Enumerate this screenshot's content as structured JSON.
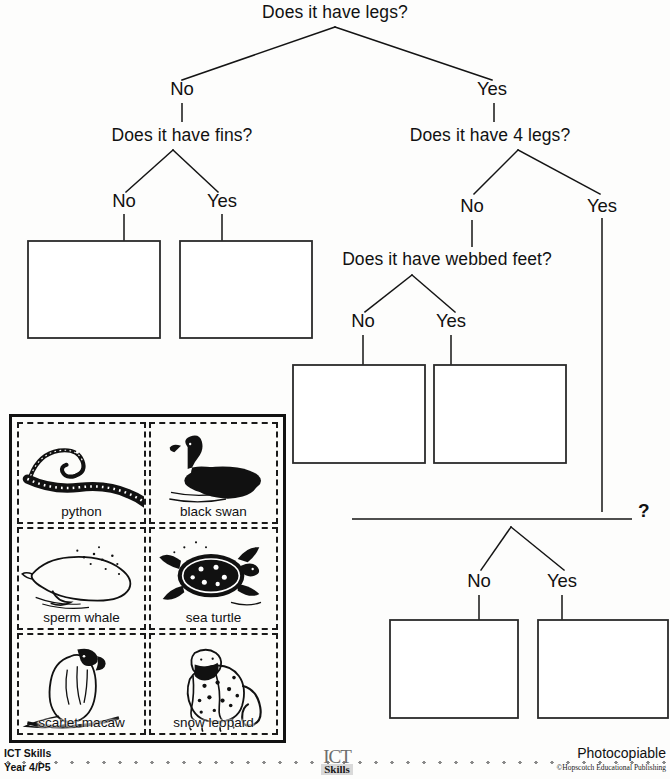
{
  "tree": {
    "root": {
      "question": "Does it have legs?"
    },
    "labels": {
      "no": "No",
      "yes": "Yes",
      "unknown": "?"
    },
    "nodes": [
      {
        "id": "q-legs",
        "question": "Does it have legs?",
        "x": 335,
        "y": 17
      },
      {
        "id": "q-fins",
        "question": "Does it have fins?",
        "x": 182,
        "y": 139
      },
      {
        "id": "q-4legs",
        "question": "Does it have 4 legs?",
        "x": 490,
        "y": 139
      },
      {
        "id": "q-webbed-feet",
        "question": "Does it have webbed feet?",
        "x": 447,
        "y": 263
      }
    ],
    "branch_labels": [
      {
        "id": "legs-no",
        "text": "No",
        "x": 182,
        "y": 94
      },
      {
        "id": "legs-yes",
        "text": "Yes",
        "x": 490,
        "y": 94
      },
      {
        "id": "fins-no",
        "text": "No",
        "x": 124,
        "y": 205
      },
      {
        "id": "fins-yes",
        "text": "Yes",
        "x": 222,
        "y": 205
      },
      {
        "id": "4legs-no",
        "text": "No",
        "x": 472,
        "y": 210
      },
      {
        "id": "4legs-yes",
        "text": "Yes",
        "x": 602,
        "y": 210
      },
      {
        "id": "webbed-no",
        "text": "No",
        "x": 363,
        "y": 325
      },
      {
        "id": "webbed-yes",
        "text": "Yes",
        "x": 451,
        "y": 325
      },
      {
        "id": "unk-no",
        "text": "No",
        "x": 479,
        "y": 585
      },
      {
        "id": "unk-yes",
        "text": "Yes",
        "x": 562,
        "y": 585
      }
    ],
    "answer_boxes": [
      {
        "id": "box-fins-no",
        "x": 28,
        "y": 241,
        "w": 132,
        "h": 97
      },
      {
        "id": "box-fins-yes",
        "x": 180,
        "y": 241,
        "w": 132,
        "h": 97
      },
      {
        "id": "box-webbed-no",
        "x": 293,
        "y": 365,
        "w": 132,
        "h": 98
      },
      {
        "id": "box-webbed-yes",
        "x": 434,
        "y": 365,
        "w": 132,
        "h": 98
      },
      {
        "id": "box-unk-no",
        "x": 390,
        "y": 620,
        "w": 128,
        "h": 98
      },
      {
        "id": "box-unk-yes",
        "x": 538,
        "y": 620,
        "w": 130,
        "h": 98
      }
    ],
    "blank_question_rule": {
      "id": "blank-question-line",
      "x1": 352,
      "y": 519,
      "x2": 632
    }
  },
  "cards": {
    "items": [
      {
        "id": "card-python",
        "label": "python",
        "art": "snake"
      },
      {
        "id": "card-black-swan",
        "label": "black swan",
        "art": "swan"
      },
      {
        "id": "card-sperm-whale",
        "label": "sperm whale",
        "art": "whale"
      },
      {
        "id": "card-sea-turtle",
        "label": "sea turtle",
        "art": "turtle"
      },
      {
        "id": "card-scarlet-macaw",
        "label": "scarlet macaw",
        "art": "macaw"
      },
      {
        "id": "card-snow-leopard",
        "label": "snow leopard",
        "art": "leopard"
      }
    ]
  },
  "footer": {
    "left_line1": "ICT Skills",
    "left_line2": "Year 4/P5",
    "logo_top": "ICT",
    "logo_bottom": "Skills",
    "right_line1": "Photocopiable",
    "right_line2": "©Hopscotch Educational Publishing"
  },
  "colors": {
    "ink": "#141414",
    "paper": "#fdfdfc",
    "box_stroke": "#2b2b2b"
  }
}
